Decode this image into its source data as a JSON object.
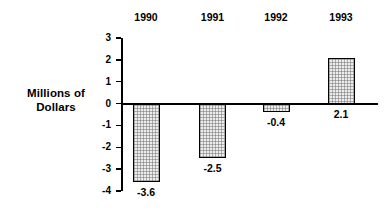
{
  "chart_data": {
    "type": "bar",
    "title": "",
    "xlabel": "",
    "ylabel": "Millions of Dollars",
    "categories": [
      "1990",
      "1991",
      "1992",
      "1993"
    ],
    "values": [
      -3.6,
      -2.5,
      -0.4,
      2.1
    ],
    "value_labels": [
      "-3.6",
      "-2.5",
      "-0.4",
      "2.1"
    ],
    "ylim": [
      -4,
      3
    ],
    "ytick_labels": [
      "3",
      "2",
      "1",
      "0",
      "-1",
      "-2",
      "-3",
      "-4"
    ],
    "ytick_values": [
      3,
      2,
      1,
      0,
      -1,
      -2,
      -3,
      -4
    ],
    "grid": false,
    "legend": "none",
    "colors": {
      "bar_fill": "#ededed",
      "bar_hatch": "#787878",
      "bar_outline": "#000000",
      "axis": "#000000",
      "text": "#000000",
      "background": "#ffffff"
    }
  },
  "axis": {
    "y_title_line1": "Millions of",
    "y_title_line2": "Dollars"
  }
}
